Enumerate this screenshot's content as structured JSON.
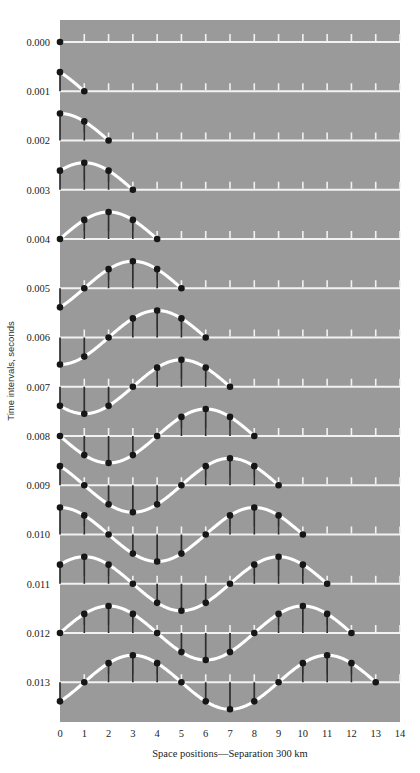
{
  "figure": {
    "title": "",
    "background_color": "#ffffff",
    "plot_background_color": "#9a9a9a",
    "curve_color": "#ffffff",
    "marker_color": "#161616",
    "stem_color": "#2e2e2e",
    "baseline_color": "#f2f2f2"
  },
  "axes": {
    "x_label": "Space positions—Separation 300 km",
    "y_label": "Time intervals, seconds",
    "x_ticks": [
      "0",
      "1",
      "2",
      "3",
      "4",
      "5",
      "6",
      "7",
      "8",
      "9",
      "10",
      "11",
      "12",
      "13",
      "14"
    ],
    "y_ticks": [
      "0.000",
      "0.001",
      "0.002",
      "0.003",
      "0.004",
      "0.005",
      "0.006",
      "0.007",
      "0.008",
      "0.009",
      "0.010",
      "0.011",
      "0.012",
      "0.013"
    ]
  },
  "chart_data": {
    "type": "line",
    "title": "",
    "subtitle": "",
    "xlabel": "Space positions—Separation 300 km",
    "ylabel": "Time intervals, seconds",
    "xlim": [
      0,
      14
    ],
    "ylim": [
      0.0,
      0.013
    ],
    "grid": false,
    "legend": "none",
    "x": [
      0,
      1,
      2,
      3,
      4,
      5,
      6,
      7,
      8,
      9,
      10,
      11,
      12,
      13,
      14
    ],
    "x_tick_labels": [
      "0",
      "1",
      "2",
      "3",
      "4",
      "5",
      "6",
      "7",
      "8",
      "9",
      "10",
      "11",
      "12",
      "13",
      "14"
    ],
    "y_tick_labels": [
      "0.000",
      "0.001",
      "0.002",
      "0.003",
      "0.004",
      "0.005",
      "0.006",
      "0.007",
      "0.008",
      "0.009",
      "0.010",
      "0.011",
      "0.012",
      "0.013"
    ],
    "annotation": "Transverse wave propagating to the right: each horizontal baseline is one time interval; black dots mark particle displacement at each space position, joined to the baseline by vertical stems; the white curve is the wave profile. Wavelength = 8 space positions (2400 km); the wave front advances one space position per 0.001 s.",
    "wavelength_positions": 8,
    "front_speed_positions_per_row": 1,
    "separation_km": 300,
    "series": [
      {
        "name": "t = 0.000 s",
        "time": "0.000",
        "front": 0,
        "values": [
          0,
          0,
          0,
          0,
          0,
          0,
          0,
          0,
          0,
          0,
          0,
          0,
          0,
          0,
          0
        ]
      },
      {
        "name": "t = 0.001 s",
        "time": "0.001",
        "front": 1,
        "values": [
          0.707,
          0,
          0,
          0,
          0,
          0,
          0,
          0,
          0,
          0,
          0,
          0,
          0,
          0,
          0
        ]
      },
      {
        "name": "t = 0.002 s",
        "time": "0.002",
        "front": 2,
        "values": [
          1.0,
          0.707,
          0,
          0,
          0,
          0,
          0,
          0,
          0,
          0,
          0,
          0,
          0,
          0,
          0
        ]
      },
      {
        "name": "t = 0.003 s",
        "time": "0.003",
        "front": 3,
        "values": [
          0.707,
          1.0,
          0.707,
          0,
          0,
          0,
          0,
          0,
          0,
          0,
          0,
          0,
          0,
          0,
          0
        ]
      },
      {
        "name": "t = 0.004 s",
        "time": "0.004",
        "front": 4,
        "values": [
          0,
          0.707,
          1.0,
          0.707,
          0,
          0,
          0,
          0,
          0,
          0,
          0,
          0,
          0,
          0,
          0
        ]
      },
      {
        "name": "t = 0.005 s",
        "time": "0.005",
        "front": 5,
        "values": [
          -0.707,
          0,
          0.707,
          1.0,
          0.707,
          0,
          0,
          0,
          0,
          0,
          0,
          0,
          0,
          0,
          0
        ]
      },
      {
        "name": "t = 0.006 s",
        "time": "0.006",
        "front": 6,
        "values": [
          -1.0,
          -0.707,
          0,
          0.707,
          1.0,
          0.707,
          0,
          0,
          0,
          0,
          0,
          0,
          0,
          0,
          0
        ]
      },
      {
        "name": "t = 0.007 s",
        "time": "0.007",
        "front": 7,
        "values": [
          -0.707,
          -1.0,
          -0.707,
          0,
          0.707,
          1.0,
          0.707,
          0,
          0,
          0,
          0,
          0,
          0,
          0,
          0
        ]
      },
      {
        "name": "t = 0.008 s",
        "time": "0.008",
        "front": 8,
        "values": [
          0,
          -0.707,
          -1.0,
          -0.707,
          0,
          0.707,
          1.0,
          0.707,
          0,
          0,
          0,
          0,
          0,
          0,
          0
        ]
      },
      {
        "name": "t = 0.009 s",
        "time": "0.009",
        "front": 9,
        "values": [
          0.707,
          0,
          -0.707,
          -1.0,
          -0.707,
          0,
          0.707,
          1.0,
          0.707,
          0,
          0,
          0,
          0,
          0,
          0
        ]
      },
      {
        "name": "t = 0.010 s",
        "time": "0.010",
        "front": 10,
        "values": [
          1.0,
          0.707,
          0,
          -0.707,
          -1.0,
          -0.707,
          0,
          0.707,
          1.0,
          0.707,
          0,
          0,
          0,
          0,
          0
        ]
      },
      {
        "name": "t = 0.011 s",
        "time": "0.011",
        "front": 11,
        "values": [
          0.707,
          1.0,
          0.707,
          0,
          -0.707,
          -1.0,
          -0.707,
          0,
          0.707,
          1.0,
          0.707,
          0,
          0,
          0,
          0
        ]
      },
      {
        "name": "t = 0.012 s",
        "time": "0.012",
        "front": 12,
        "values": [
          0,
          0.707,
          1.0,
          0.707,
          0,
          -0.707,
          -1.0,
          -0.707,
          0,
          0.707,
          1.0,
          0.707,
          0,
          0,
          0
        ]
      },
      {
        "name": "t = 0.013 s",
        "time": "0.013",
        "front": 13,
        "values": [
          -0.707,
          0,
          0.707,
          1.0,
          0.707,
          0,
          -0.707,
          -1.0,
          -0.707,
          0,
          0.707,
          1.0,
          0.707,
          0,
          0
        ]
      }
    ]
  }
}
